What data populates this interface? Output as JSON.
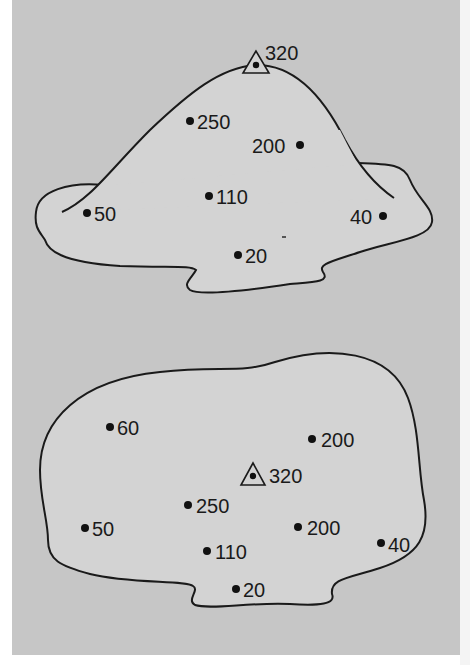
{
  "figure": {
    "background_color": "#c6c6c6",
    "shape_fill_color": "#d3d3d3",
    "line_color": "#1a1a1a",
    "side_view": {
      "title": "profile",
      "summit": {
        "label": "320",
        "marker": "triangle-icon",
        "x": 255,
        "y": 63
      },
      "points": [
        {
          "label": "250",
          "x": 190,
          "y": 120,
          "label_side": "right"
        },
        {
          "label": "200",
          "x": 300,
          "y": 145,
          "label_side": "left"
        },
        {
          "label": "110",
          "x": 209,
          "y": 195,
          "label_side": "right"
        },
        {
          "label": "50",
          "x": 87,
          "y": 213,
          "label_side": "right"
        },
        {
          "label": "40",
          "x": 383,
          "y": 215,
          "label_side": "left"
        },
        {
          "label": "20",
          "x": 238,
          "y": 255,
          "label_side": "right"
        }
      ]
    },
    "plan_view": {
      "title": "map",
      "summit": {
        "label": "320",
        "marker": "triangle-icon",
        "x": 253,
        "y": 475
      },
      "points": [
        {
          "label": "60",
          "x": 110,
          "y": 427,
          "label_side": "right"
        },
        {
          "label": "200",
          "x": 312,
          "y": 439,
          "label_side": "right"
        },
        {
          "label": "250",
          "x": 188,
          "y": 505,
          "label_side": "right"
        },
        {
          "label": "50",
          "x": 85,
          "y": 528,
          "label_side": "right"
        },
        {
          "label": "200",
          "x": 298,
          "y": 527,
          "label_side": "right"
        },
        {
          "label": "110",
          "x": 207,
          "y": 551,
          "label_side": "right"
        },
        {
          "label": "40",
          "x": 381,
          "y": 543,
          "label_side": "right"
        },
        {
          "label": "20",
          "x": 236,
          "y": 589,
          "label_side": "right"
        }
      ]
    }
  }
}
